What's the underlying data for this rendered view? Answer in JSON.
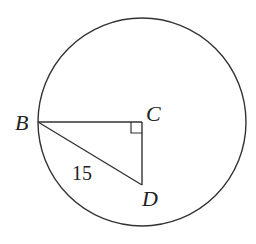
{
  "diagram": {
    "type": "geometry",
    "circle": {
      "center": [
        142,
        122
      ],
      "radius": 104
    },
    "points": {
      "B": {
        "label": "B",
        "x": 38,
        "y": 122
      },
      "C": {
        "label": "C",
        "x": 142,
        "y": 122
      },
      "D": {
        "label": "D",
        "x": 142,
        "y": 185
      }
    },
    "segments": [
      {
        "from": "B",
        "to": "C"
      },
      {
        "from": "C",
        "to": "D"
      },
      {
        "from": "B",
        "to": "D",
        "length_label": "15"
      }
    ],
    "right_angle_at": "C",
    "labels": {
      "B": "B",
      "C": "C",
      "D": "D",
      "bd_length": "15"
    },
    "stroke_color": "#333333"
  }
}
